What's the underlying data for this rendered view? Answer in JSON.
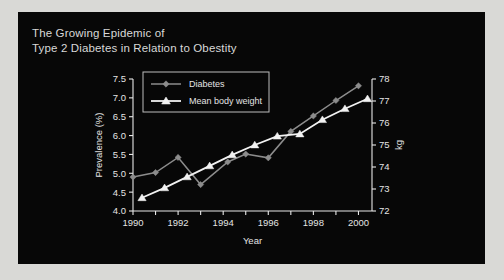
{
  "panel": {
    "background_color": "#070707",
    "outer_background_color": "#d9d9d6"
  },
  "title": {
    "line1": "The Growing Epidemic of",
    "line2": "Type 2 Diabetes in Relation to Obestity",
    "full": "The Growing Epidemic of\nType 2 Diabetes in Relation to Obestity",
    "color": "#d8d8d8"
  },
  "chart_data": {
    "type": "line",
    "title": "The Growing Epidemic of Type 2 Diabetes in Relation to Obestity",
    "xlabel": "Year",
    "ylabel": "Prevalence (%)",
    "y2label": "kg",
    "xlim": [
      1990,
      2000.6
    ],
    "ylim": [
      4.0,
      7.5
    ],
    "y2lim": [
      72,
      78
    ],
    "grid": false,
    "legend_position": "top-left-inside",
    "x_ticks": [
      1990,
      1991,
      1992,
      1993,
      1994,
      1995,
      1996,
      1997,
      1998,
      1999,
      2000
    ],
    "x_tick_labels": [
      "1990",
      "",
      "1992",
      "",
      "1994",
      "",
      "1996",
      "",
      "1998",
      "",
      "2000"
    ],
    "y_ticks": [
      4.0,
      4.5,
      5.0,
      5.5,
      6.0,
      6.5,
      7.0,
      7.5
    ],
    "y_tick_labels": [
      "4.0",
      "4.5",
      "5.0",
      "5.5",
      "6.0",
      "6.5",
      "7.0",
      "7.5"
    ],
    "y2_ticks": [
      72,
      73,
      74,
      75,
      76,
      77,
      78
    ],
    "y2_tick_labels": [
      "72",
      "73",
      "74",
      "75",
      "76",
      "77",
      "78"
    ],
    "series": [
      {
        "name": "Diabetes",
        "axis": "left",
        "marker": "diamond",
        "color": "#8c8c8c",
        "x": [
          1990.0,
          1991.0,
          1992.0,
          1993.0,
          1994.2,
          1995.0,
          1996.0,
          1997.0,
          1998.0,
          1999.0,
          2000.0
        ],
        "values": [
          4.9,
          5.02,
          5.42,
          4.7,
          5.3,
          5.51,
          5.41,
          6.11,
          6.52,
          6.93,
          7.32
        ]
      },
      {
        "name": "Mean body weight",
        "axis": "right",
        "marker": "triangle",
        "color": "#f2f2f2",
        "x": [
          1990.4,
          1991.4,
          1992.4,
          1993.4,
          1994.4,
          1995.4,
          1996.4,
          1997.4,
          1998.4,
          1999.4,
          2000.4
        ],
        "values": [
          72.6,
          73.05,
          73.55,
          74.05,
          74.55,
          75.0,
          75.4,
          75.5,
          76.15,
          76.65,
          77.1
        ]
      }
    ]
  },
  "legend": {
    "items": [
      {
        "label": "Diabetes",
        "marker": "diamond",
        "color": "#8c8c8c"
      },
      {
        "label": "Mean body weight",
        "marker": "triangle",
        "color": "#f2f2f2"
      }
    ]
  }
}
